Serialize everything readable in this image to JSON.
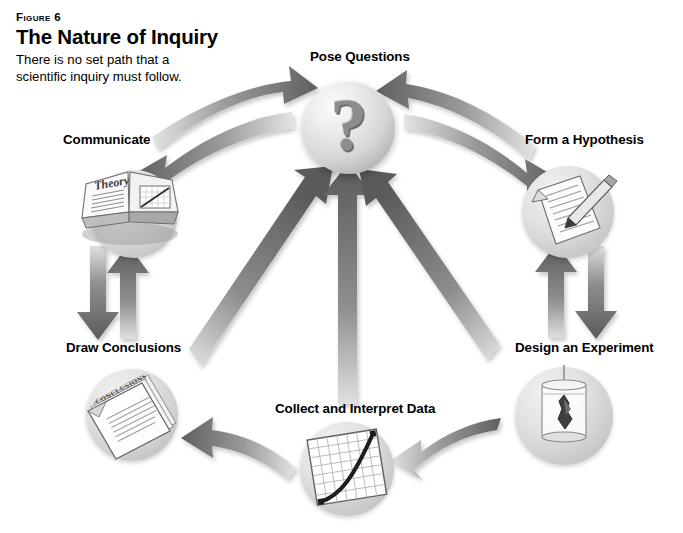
{
  "figure": {
    "kicker": "Figure 6",
    "title": "The Nature of Inquiry",
    "caption_line1": "There is no set path that a",
    "caption_line2": "scientific inquiry must follow."
  },
  "colors": {
    "arrow_dark": "#6b6b6b",
    "arrow_light": "#d9d9d9",
    "sphere_gray": "#cfcfcf",
    "text": "#000000",
    "page_background": "#ffffff"
  },
  "diagram": {
    "type": "cycle",
    "center": {
      "label": "Pose Questions",
      "icon": "question-mark-sphere",
      "glyph": "?"
    },
    "nodes": [
      {
        "id": "pose-questions",
        "label": "Pose Questions",
        "icon": "question-mark-sphere",
        "position": "top"
      },
      {
        "id": "form-a-hypothesis",
        "label": "Form a Hypothesis",
        "icon": "document-pencil-icon",
        "position": "right-top"
      },
      {
        "id": "design-an-experiment",
        "label": "Design an Experiment",
        "icon": "beaker-crystal-icon",
        "position": "right-bottom"
      },
      {
        "id": "collect-interpret",
        "label": "Collect and Interpret Data",
        "icon": "graph-grid-icon",
        "position": "bottom"
      },
      {
        "id": "draw-conclusions",
        "label": "Draw Conclusions",
        "icon": "conclusions-papers-icon",
        "position": "left-bottom"
      },
      {
        "id": "communicate",
        "label": "Communicate",
        "icon": "open-book-icon",
        "position": "left-top"
      }
    ],
    "icon_text": {
      "book_word": "Theory",
      "conclusions_word": "CONCLUSIONS"
    },
    "connections": [
      {
        "from": "communicate",
        "to": "pose-questions",
        "style": "curved",
        "direction": "one-way"
      },
      {
        "from": "pose-questions",
        "to": "communicate",
        "style": "curved",
        "direction": "one-way"
      },
      {
        "from": "pose-questions",
        "to": "form-a-hypothesis",
        "style": "curved",
        "direction": "one-way"
      },
      {
        "from": "form-a-hypothesis",
        "to": "pose-questions",
        "style": "curved",
        "direction": "one-way"
      },
      {
        "from": "communicate",
        "to": "draw-conclusions",
        "style": "straight",
        "direction": "one-way"
      },
      {
        "from": "draw-conclusions",
        "to": "communicate",
        "style": "straight",
        "direction": "one-way"
      },
      {
        "from": "form-a-hypothesis",
        "to": "design-an-experiment",
        "style": "straight",
        "direction": "one-way"
      },
      {
        "from": "design-an-experiment",
        "to": "form-a-hypothesis",
        "style": "straight",
        "direction": "one-way"
      },
      {
        "from": "collect-interpret",
        "to": "draw-conclusions",
        "style": "curved",
        "direction": "one-way"
      },
      {
        "from": "design-an-experiment",
        "to": "collect-interpret",
        "style": "curved",
        "direction": "one-way"
      },
      {
        "from": "draw-conclusions",
        "to": "pose-questions",
        "style": "straight",
        "direction": "one-way"
      },
      {
        "from": "collect-interpret",
        "to": "pose-questions",
        "style": "straight",
        "direction": "one-way"
      },
      {
        "from": "design-an-experiment",
        "to": "pose-questions",
        "style": "straight",
        "direction": "one-way"
      }
    ]
  }
}
